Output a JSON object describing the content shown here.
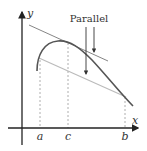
{
  "diagram": {
    "annotation": "Parallel",
    "axes": {
      "x_label": "x",
      "y_label": "y"
    },
    "points": [
      {
        "label": "a",
        "x": 40
      },
      {
        "label": "c",
        "x": 68
      },
      {
        "label": "b",
        "x": 125
      }
    ],
    "colors": {
      "curve": "#555555",
      "tangent": "#777777",
      "secant": "#bbbbbb",
      "axes": "#222222",
      "dashed": "#999999"
    }
  }
}
